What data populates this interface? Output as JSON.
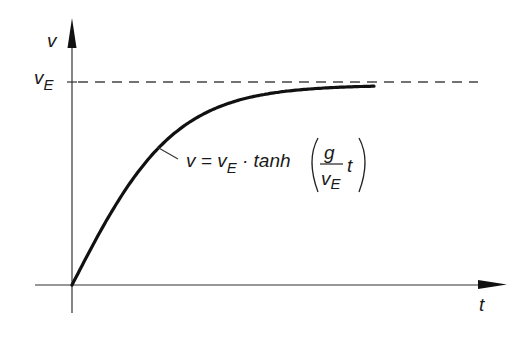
{
  "chart_data": {
    "type": "line",
    "title": "",
    "xlabel": "t",
    "ylabel": "v",
    "asymptote": {
      "label": "v",
      "label_subscript": "E",
      "meaning": "terminal velocity v_E",
      "style": "dashed"
    },
    "annotation": {
      "lhs": "v = v",
      "lhs_subscript": "E",
      "operator": " · tanh",
      "frac_num": "g",
      "frac_den": "v",
      "frac_den_subscript": "E",
      "after_frac": "t"
    },
    "series": [
      {
        "name": "v = v_E · tanh(g/v_E · t)",
        "x_normalized": [
          0,
          0.1,
          0.2,
          0.3,
          0.4,
          0.5,
          0.6,
          0.7,
          0.8,
          0.9,
          1.0
        ],
        "y_normalized": [
          0,
          0.29,
          0.53,
          0.71,
          0.82,
          0.9,
          0.94,
          0.965,
          0.98,
          0.985,
          0.985
        ]
      }
    ],
    "y_tick_labels": [
      "v_E"
    ],
    "x_tick_labels": [],
    "grid": false,
    "legend": null,
    "colors": {
      "line": "#111111",
      "axis": "#333333",
      "dash": "#444444"
    }
  }
}
